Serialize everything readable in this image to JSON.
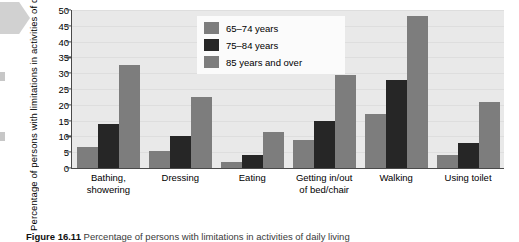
{
  "figure": {
    "caption_label": "Figure 16.11",
    "caption_text": "Percentage of persons with limitations in activities of daily living"
  },
  "legend": {
    "position": "top-center",
    "items": [
      {
        "label": "65–74 years",
        "color": "#7d7d7d"
      },
      {
        "label": "75–84 years",
        "color": "#262626"
      },
      {
        "label": "85 years and over",
        "color": "#7d7d7d"
      }
    ]
  },
  "chart_data": {
    "type": "bar",
    "title": "",
    "subtitle": "",
    "xlabel": "",
    "ylabel": "Percentage of persons with limitations in activities of daily living",
    "ylim": [
      0,
      50
    ],
    "ytick_step": 5,
    "yticks": [
      0,
      5,
      10,
      15,
      20,
      25,
      30,
      35,
      40,
      45,
      50
    ],
    "grid": true,
    "grid_axis": "y",
    "legend_position": "top-center",
    "categories": [
      "Bathing, showering",
      "Dressing",
      "Eating",
      "Getting in/out of bed/chair",
      "Walking",
      "Using toilet"
    ],
    "category_lines": [
      [
        "Bathing,",
        "showering"
      ],
      [
        "Dressing"
      ],
      [
        "Eating"
      ],
      [
        "Getting in/out",
        "of bed/chair"
      ],
      [
        "Walking"
      ],
      [
        "Using toilet"
      ]
    ],
    "series": [
      {
        "name": "65–74 years",
        "color": "#7d7d7d",
        "values": [
          6.5,
          5.5,
          2,
          9,
          17,
          4
        ]
      },
      {
        "name": "75–84 years",
        "color": "#262626",
        "values": [
          14,
          10,
          4,
          15,
          28,
          8
        ]
      },
      {
        "name": "85 years and over",
        "color": "#7d7d7d",
        "values": [
          32.5,
          22.5,
          11.5,
          29.5,
          48,
          21
        ]
      }
    ]
  }
}
